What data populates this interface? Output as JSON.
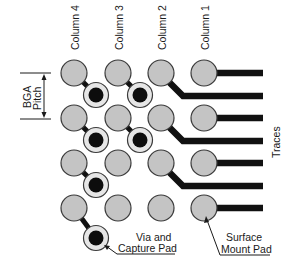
{
  "figure": {
    "column_labels": [
      "Column 4",
      "Column 3",
      "Column 2",
      "Column 1"
    ],
    "pitch_label_line1": "BGA",
    "pitch_label_line2": "Pitch",
    "traces_label": "Traces",
    "via_label_line1": "Via and",
    "via_label_line2": "Capture Pad",
    "pad_label_line1": "Surface",
    "pad_label_line2": "Mount Pad"
  },
  "colors": {
    "pad_fill": "#c4c4c4",
    "pad_stroke": "#3a3a3a",
    "via_fill": "#0d0d0d",
    "capture_pad_fill": "#e6e6e6",
    "trace": "#111111",
    "background": "#ffffff"
  }
}
